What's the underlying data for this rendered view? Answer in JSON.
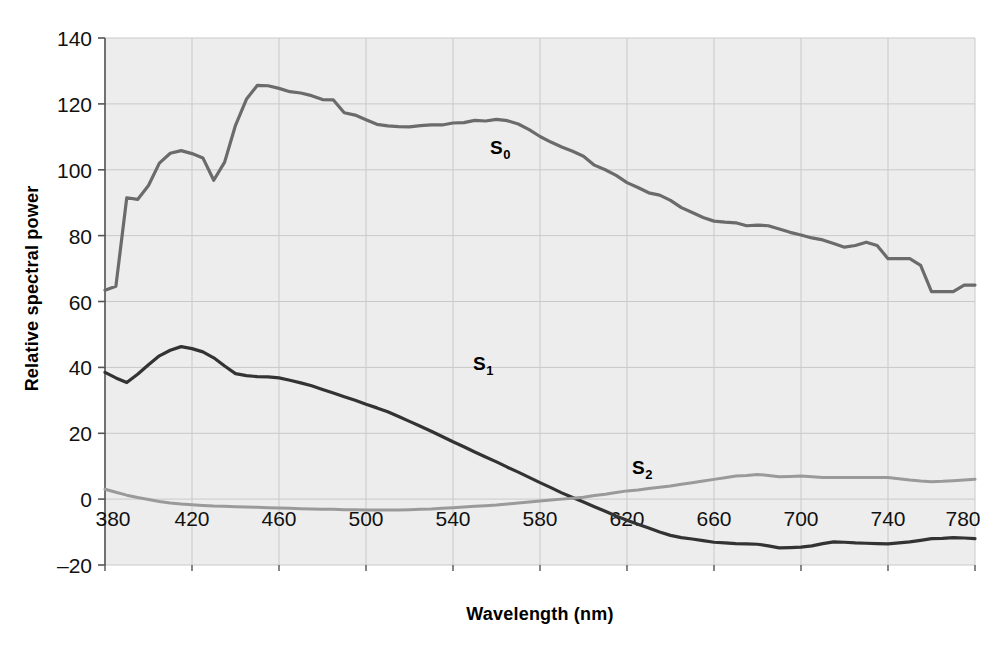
{
  "chart_data": {
    "type": "line",
    "title": "",
    "xlabel": "Wavelength (nm)",
    "ylabel": "Relative spectral power",
    "xlim": [
      380,
      780
    ],
    "ylim": [
      -20,
      140
    ],
    "grid": true,
    "legend_position": "inline-annotations",
    "plot_background": "#ededed",
    "x_ticks": [
      "380",
      "420",
      "460",
      "500",
      "540",
      "580",
      "620",
      "660",
      "700",
      "740",
      "780"
    ],
    "x_tick_values": [
      380,
      420,
      460,
      500,
      540,
      580,
      620,
      660,
      700,
      740,
      780
    ],
    "y_ticks": [
      "-20",
      "0",
      "20",
      "40",
      "60",
      "80",
      "100",
      "120",
      "140"
    ],
    "y_tick_values": [
      -20,
      0,
      20,
      40,
      60,
      80,
      100,
      120,
      140
    ],
    "x": [
      380,
      385,
      390,
      395,
      400,
      405,
      410,
      415,
      420,
      425,
      430,
      435,
      440,
      445,
      450,
      455,
      460,
      465,
      470,
      475,
      480,
      485,
      490,
      495,
      500,
      505,
      510,
      515,
      520,
      525,
      530,
      535,
      540,
      545,
      550,
      555,
      560,
      565,
      570,
      575,
      580,
      585,
      590,
      595,
      600,
      605,
      610,
      615,
      620,
      625,
      630,
      635,
      640,
      645,
      650,
      655,
      660,
      665,
      670,
      675,
      680,
      685,
      690,
      695,
      700,
      705,
      710,
      715,
      720,
      725,
      730,
      735,
      740,
      745,
      750,
      755,
      760,
      765,
      770,
      775,
      780
    ],
    "series": [
      {
        "name": "S0",
        "label": "S",
        "label_sub": "0",
        "color": "#6b6b6b",
        "stroke_width": 3.2,
        "label_x": 490,
        "label_y": 154,
        "values": [
          63.4,
          64.6,
          91.5,
          91.0,
          95.2,
          102.0,
          105.0,
          105.8,
          104.9,
          103.6,
          96.8,
          102.3,
          113.5,
          121.4,
          125.6,
          125.5,
          124.7,
          123.7,
          123.3,
          122.5,
          121.3,
          121.2,
          117.3,
          116.6,
          115.2,
          113.8,
          113.3,
          113.1,
          113.0,
          113.4,
          113.6,
          113.6,
          114.2,
          114.3,
          115.0,
          114.8,
          115.3,
          114.9,
          113.9,
          112.2,
          110.1,
          108.4,
          106.9,
          105.6,
          104.1,
          101.4,
          100.0,
          98.3,
          96.1,
          94.6,
          93.0,
          92.3,
          90.7,
          88.5,
          87.0,
          85.5,
          84.4,
          84.1,
          83.9,
          83.0,
          83.2,
          83.0,
          82.0,
          81.0,
          80.2,
          79.3,
          78.7,
          77.6,
          76.5,
          77.0,
          78.0,
          77.0,
          73.0,
          73.0,
          73.0,
          71.0,
          63.0,
          63.0,
          63.0,
          65.0,
          65.0
        ]
      },
      {
        "name": "S1",
        "label": "S",
        "label_sub": "1",
        "color": "#333333",
        "stroke_width": 3.2,
        "label_x": 473,
        "label_y": 370,
        "values": [
          38.5,
          36.8,
          35.4,
          37.9,
          40.8,
          43.5,
          45.2,
          46.3,
          45.7,
          44.7,
          42.9,
          40.4,
          38.1,
          37.5,
          37.2,
          37.1,
          36.8,
          36.1,
          35.3,
          34.4,
          33.3,
          32.2,
          31.1,
          30.0,
          28.8,
          27.7,
          26.5,
          25.1,
          23.6,
          22.1,
          20.6,
          19.0,
          17.4,
          15.9,
          14.3,
          12.8,
          11.3,
          9.7,
          8.2,
          6.6,
          5.0,
          3.5,
          1.9,
          0.5,
          -0.9,
          -2.3,
          -3.7,
          -5.1,
          -6.4,
          -7.6,
          -8.8,
          -10.0,
          -11.0,
          -11.7,
          -12.1,
          -12.6,
          -13.1,
          -13.3,
          -13.5,
          -13.6,
          -13.7,
          -14.2,
          -14.8,
          -14.7,
          -14.6,
          -14.2,
          -13.5,
          -13.0,
          -13.1,
          -13.3,
          -13.4,
          -13.5,
          -13.6,
          -13.3,
          -13.0,
          -12.5,
          -12.0,
          -11.9,
          -11.7,
          -11.8,
          -12.0
        ]
      },
      {
        "name": "S2",
        "label": "S",
        "label_sub": "2",
        "color": "#9a9a9a",
        "stroke_width": 3.0,
        "label_x": 632,
        "label_y": 474,
        "values": [
          3.0,
          2.1,
          1.2,
          0.5,
          -0.1,
          -0.7,
          -1.2,
          -1.5,
          -1.7,
          -1.9,
          -2.1,
          -2.2,
          -2.3,
          -2.4,
          -2.5,
          -2.6,
          -2.7,
          -2.8,
          -2.9,
          -3.0,
          -3.1,
          -3.1,
          -3.2,
          -3.2,
          -3.3,
          -3.3,
          -3.3,
          -3.3,
          -3.2,
          -3.1,
          -3.0,
          -2.8,
          -2.6,
          -2.4,
          -2.2,
          -2.0,
          -1.8,
          -1.5,
          -1.2,
          -0.9,
          -0.6,
          -0.3,
          0.0,
          0.3,
          0.6,
          1.1,
          1.5,
          2.0,
          2.5,
          2.8,
          3.2,
          3.6,
          4.0,
          4.5,
          5.0,
          5.5,
          6.0,
          6.5,
          7.0,
          7.2,
          7.5,
          7.2,
          6.8,
          6.9,
          7.0,
          6.8,
          6.6,
          6.6,
          6.6,
          6.6,
          6.6,
          6.6,
          6.6,
          6.2,
          5.8,
          5.5,
          5.3,
          5.4,
          5.6,
          5.8,
          6.0
        ]
      }
    ]
  },
  "axes": {
    "x_title": "Wavelength (nm)",
    "y_title": "Relative spectral power"
  },
  "annotations": [
    {
      "id": "s0",
      "text": "S",
      "sub": "0"
    },
    {
      "id": "s1",
      "text": "S",
      "sub": "1"
    },
    {
      "id": "s2",
      "text": "S",
      "sub": "2"
    }
  ]
}
